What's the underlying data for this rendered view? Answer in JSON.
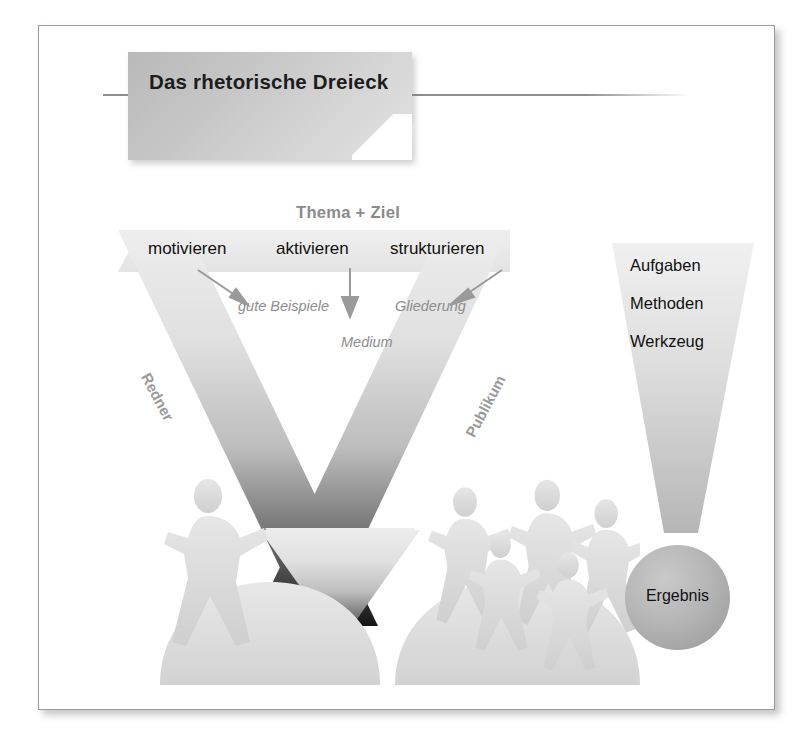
{
  "page": {
    "title": "Das rhetorische Dreieck",
    "frame_border_color": "#9a9a9a",
    "background": "#ffffff"
  },
  "diagram": {
    "name": "rhetorisches-dreieck",
    "apex_label": "Thema + Ziel",
    "top_row": [
      {
        "key": "motivieren",
        "label": "motivieren"
      },
      {
        "key": "aktivieren",
        "label": "aktivieren"
      },
      {
        "key": "strukturieren",
        "label": "strukturieren"
      }
    ],
    "sub_labels": [
      {
        "key": "gute-beispiele",
        "label": "gute Beispiele",
        "style": "italic-gray"
      },
      {
        "key": "medium",
        "label": "Medium",
        "style": "italic-gray"
      },
      {
        "key": "gliederung",
        "label": "Gliederung",
        "style": "italic-gray"
      }
    ],
    "side_labels": [
      {
        "key": "redner",
        "label": "Redner"
      },
      {
        "key": "publikum",
        "label": "Publikum"
      }
    ],
    "arrows": [
      {
        "key": "arrow-left",
        "from": "motivieren",
        "to": "gute Beispiele",
        "direction": "down-right"
      },
      {
        "key": "arrow-center",
        "from": "aktivieren",
        "to": "Medium",
        "direction": "down"
      },
      {
        "key": "arrow-right",
        "from": "strukturieren",
        "to": "Gliederung",
        "direction": "down-left"
      }
    ],
    "figures": {
      "speaker_count": 1,
      "audience_count": 5,
      "speaker_name": "Redner",
      "audience_name": "Publikum"
    }
  },
  "funnel": {
    "items": [
      {
        "key": "aufgaben",
        "label": "Aufgaben"
      },
      {
        "key": "methoden",
        "label": "Methoden"
      },
      {
        "key": "werkzeug",
        "label": "Werkzeug"
      }
    ],
    "result_label": "Ergebnis"
  },
  "colors": {
    "ink": "#111111",
    "gray_text": "#8d8d8d",
    "band_light": "#e4e4e4",
    "band_dark": "#1f1f1f",
    "circle": "#b0b0b0",
    "frame": "#9a9a9a"
  }
}
